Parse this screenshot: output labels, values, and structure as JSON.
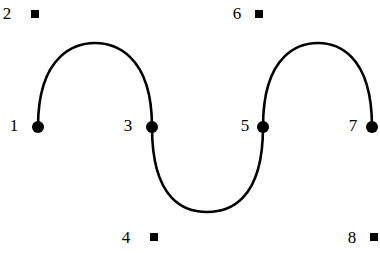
{
  "figure": {
    "type": "graph-diagram",
    "background_color": "#ffffff",
    "stroke_color": "#000000",
    "curve_stroke_width": 2.6,
    "dot_radius": 6,
    "square_size": 8,
    "width": 380,
    "height": 253,
    "nodes": [
      {
        "id": "1",
        "label": "1",
        "marker": "dot",
        "marker_x": 38,
        "marker_y": 127,
        "label_x": 14,
        "label_y": 125
      },
      {
        "id": "2",
        "label": "2",
        "marker": "square",
        "marker_x": 35,
        "marker_y": 14,
        "label_x": 7,
        "label_y": 13
      },
      {
        "id": "3",
        "label": "3",
        "marker": "dot",
        "marker_x": 152,
        "marker_y": 127,
        "label_x": 128,
        "label_y": 125
      },
      {
        "id": "4",
        "label": "4",
        "marker": "square",
        "marker_x": 154,
        "marker_y": 237,
        "label_x": 126,
        "label_y": 237
      },
      {
        "id": "5",
        "label": "5",
        "marker": "dot",
        "marker_x": 263,
        "marker_y": 127,
        "label_x": 245,
        "label_y": 125
      },
      {
        "id": "6",
        "label": "6",
        "marker": "square",
        "marker_x": 259,
        "marker_y": 14,
        "label_x": 237,
        "label_y": 13
      },
      {
        "id": "7",
        "label": "7",
        "marker": "dot",
        "marker_x": 372,
        "marker_y": 127,
        "label_x": 353,
        "label_y": 125
      },
      {
        "id": "8",
        "label": "8",
        "marker": "square",
        "marker_x": 374,
        "marker_y": 237,
        "label_x": 352,
        "label_y": 237
      }
    ],
    "curve_path": "M 38 127 C 38 52, 78 43, 95 43 C 112 43, 152 52, 152 127 C 152 202, 186 212, 207 212 C 228 212, 263 202, 263 127 C 263 52, 301 43, 318 43 C 335 43, 372 52, 372 127",
    "arcs": [
      {
        "from": "1",
        "to": "3",
        "direction": "up",
        "apex_x": 95,
        "apex_y": 43
      },
      {
        "from": "3",
        "to": "5",
        "direction": "down",
        "apex_x": 207,
        "apex_y": 212
      },
      {
        "from": "5",
        "to": "7",
        "direction": "up",
        "apex_x": 318,
        "apex_y": 43
      }
    ]
  }
}
